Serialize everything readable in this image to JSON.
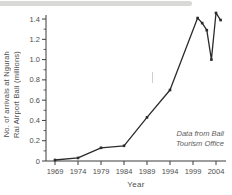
{
  "chart_data": {
    "type": "line",
    "title": "",
    "xlabel": "Year",
    "ylabel_lines": [
      "No. of arrivals at Ngurah",
      "Rai Airport Bali (millions)"
    ],
    "annotation_lines": [
      "Data from Bali",
      "Tourism Office"
    ],
    "x": [
      1969,
      1974,
      1979,
      1984,
      1989,
      1994,
      2000,
      2001,
      2002,
      2003,
      2004,
      2005
    ],
    "y": [
      0.01,
      0.03,
      0.13,
      0.15,
      0.43,
      0.7,
      1.41,
      1.36,
      1.29,
      1.0,
      1.46,
      1.39
    ],
    "x_ticks": [
      1969,
      1974,
      1979,
      1984,
      1989,
      1994,
      1999,
      2004
    ],
    "y_ticks": [
      0,
      0.2,
      0.4,
      0.6,
      0.8,
      1.0,
      1.2,
      1.4
    ],
    "y_tick_labels": [
      "0",
      "0.2",
      "0.4",
      "0.6",
      "0.8",
      "1.0",
      "1.2",
      "1.4"
    ],
    "y_minor_step": 0.1,
    "xlim": [
      1967,
      2006
    ],
    "ylim": [
      0,
      1.45
    ],
    "grid": false,
    "legend": null,
    "line_color": "#2b2b2b",
    "axis_color": "#3c3c3c",
    "tick_label_color": "#4e4e4e",
    "marker": "square"
  }
}
